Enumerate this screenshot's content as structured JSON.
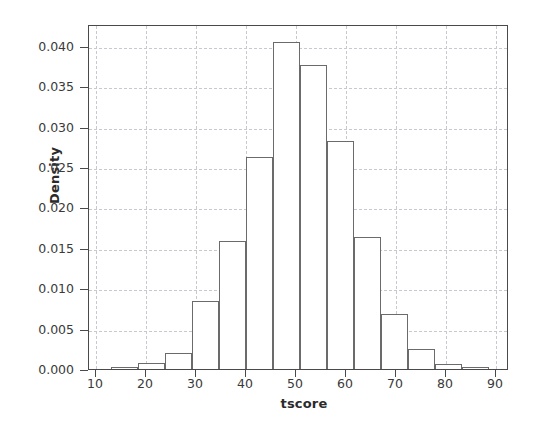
{
  "chart_data": {
    "type": "bar",
    "title": "",
    "subtitle": "",
    "xlabel": "tscore",
    "ylabel": "Density",
    "xlim": [
      8.6,
      92.6
    ],
    "ylim": [
      0.0,
      0.0427
    ],
    "grid": true,
    "legend": false,
    "legend_position": "none",
    "histogram": true,
    "bin_width": 5.4,
    "bin_edges": [
      13.0,
      18.4,
      23.8,
      29.2,
      34.6,
      40.0,
      45.4,
      50.8,
      56.2,
      61.6,
      67.0,
      72.4,
      77.8,
      83.2,
      88.6
    ],
    "categories": [
      "13.0-18.4",
      "18.4-23.8",
      "23.8-29.2",
      "29.2-34.6",
      "34.6-40.0",
      "40.0-45.4",
      "45.4-50.8",
      "50.8-56.2",
      "56.2-61.6",
      "61.6-67.0",
      "67.0-72.4",
      "72.4-77.8",
      "77.8-83.2",
      "83.2-88.6"
    ],
    "values": [
      0.0002,
      0.0007,
      0.002,
      0.0084,
      0.0158,
      0.0262,
      0.0405,
      0.0376,
      0.0282,
      0.0163,
      0.0068,
      0.0025,
      0.0006,
      0.0002
    ],
    "series": [
      {
        "name": "Density",
        "values": [
          0.0002,
          0.0007,
          0.002,
          0.0084,
          0.0158,
          0.0262,
          0.0405,
          0.0376,
          0.0282,
          0.0163,
          0.0068,
          0.0025,
          0.0006,
          0.0002
        ]
      }
    ],
    "xticks": [
      10,
      20,
      30,
      40,
      50,
      60,
      70,
      80,
      90
    ],
    "xtick_labels": [
      "10",
      "20",
      "30",
      "40",
      "50",
      "60",
      "70",
      "80",
      "90"
    ],
    "yticks": [
      0.0,
      0.005,
      0.01,
      0.015,
      0.02,
      0.025,
      0.03,
      0.035,
      0.04
    ],
    "ytick_labels": [
      "0.000",
      "0.005",
      "0.010",
      "0.015",
      "0.020",
      "0.025",
      "0.030",
      "0.035",
      "0.040"
    ],
    "colors": {
      "bar_edge": "#6b6b6b",
      "bar_fill": "#ffffff",
      "grid": "#c8c8d0",
      "axis": "#4a4a4a",
      "text": "#2b2b2b",
      "background": "#ffffff"
    }
  }
}
